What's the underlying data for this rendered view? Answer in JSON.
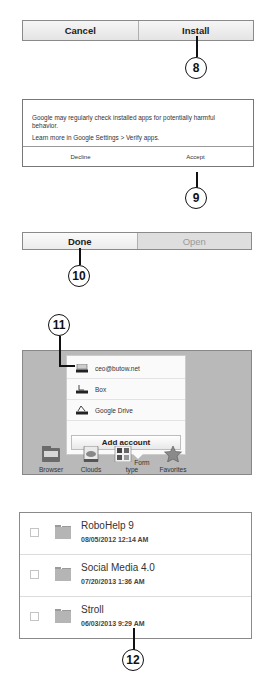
{
  "install_bar": {
    "cancel_label": "Cancel",
    "install_label": "Install",
    "callout": "8"
  },
  "verify_dialog": {
    "message": "Google may regularly check installed apps for potentially harmful behavior.",
    "learn_more": "Learn more in Google Settings > Verify apps.",
    "decline_label": "Decline",
    "accept_label": "Accept",
    "callout": "9"
  },
  "done_bar": {
    "done_label": "Done",
    "open_label": "Open",
    "callout": "10"
  },
  "clouds_panel": {
    "callout": "11",
    "accounts": [
      {
        "label": "ceo@butow.net",
        "icon": "account-icon"
      },
      {
        "label": "Box",
        "icon": "box-icon"
      },
      {
        "label": "Google Drive",
        "icon": "google-drive-icon"
      }
    ],
    "add_account_label": "Add account",
    "toolbar": [
      {
        "label": "Browser",
        "icon": "browser-icon"
      },
      {
        "label": "Clouds",
        "icon": "clouds-icon"
      },
      {
        "label": "Form type",
        "icon": "form-type-icon"
      },
      {
        "label": "Favorites",
        "icon": "favorites-star-icon"
      }
    ]
  },
  "file_list": {
    "callout": "12",
    "items": [
      {
        "name": "RoboHelp 9",
        "date": "08/05/2012 12:14 AM"
      },
      {
        "name": "Social Media 4.0",
        "date": "07/20/2013 1:36 AM"
      },
      {
        "name": "Stroll",
        "date": "06/03/2013 9:29 AM"
      }
    ]
  }
}
